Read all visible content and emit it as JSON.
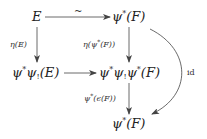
{
  "diagram": {
    "type": "commutative-diagram",
    "nodes": {
      "E": {
        "base": "E"
      },
      "psi_star_F_top": {
        "pre": "ψ",
        "sup": "*",
        "post": "(F)"
      },
      "psi_star_psi_shriek_E": {
        "p1": "ψ",
        "s1": "*",
        "p2": "ψ",
        "sb": "!",
        "post": "(E)"
      },
      "psi_star_psi_shriek_psi_star_F": {
        "p1": "ψ",
        "s1": "*",
        "p2": "ψ",
        "sb": "!",
        "p3": "ψ",
        "s3": "*",
        "post": "(F)"
      },
      "psi_star_F_bottom": {
        "pre": "ψ",
        "sup": "*",
        "post": "(F)"
      }
    },
    "arrows": [
      {
        "from": "E",
        "to": "ψ*(F)",
        "label": "~"
      },
      {
        "from": "E",
        "to": "ψ*ψ!(E)",
        "label": "η(E)"
      },
      {
        "from": "ψ*(F)",
        "to": "ψ*ψ!ψ*(F)",
        "label_pre": "η(ψ",
        "label_sup": "*",
        "label_post": "(F))"
      },
      {
        "from": "ψ*ψ!(E)",
        "to": "ψ*ψ!ψ*(F)",
        "label": ""
      },
      {
        "from": "ψ*ψ!ψ*(F)",
        "to": "ψ*(F)",
        "label_pre": "ψ",
        "label_sup": "*",
        "label_post": "(ϵ(F))"
      },
      {
        "from": "ψ*(F)",
        "to": "ψ*(F)",
        "label": "id",
        "curved": true
      }
    ],
    "colors": {
      "ink": "#222222",
      "arrow": "#444444",
      "background": "#ffffff"
    }
  }
}
